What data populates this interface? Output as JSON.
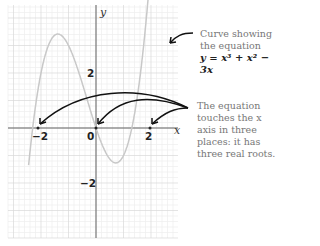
{
  "chart_data": {
    "type": "line",
    "title": "",
    "equation": "y = x³ + x² − 3x",
    "xlabel": "x",
    "ylabel": "y",
    "x_ticks": [
      "−2",
      "0",
      "2"
    ],
    "y_ticks": [
      "2",
      "0",
      "−2"
    ],
    "xlim": [
      -3.3,
      2.9
    ],
    "ylim": [
      -4.2,
      4.5
    ],
    "grid": true,
    "roots": [
      -2.3,
      0,
      1.3
    ],
    "series": [
      {
        "name": "y = x³ + x² − 3x",
        "color": "#c8c8c8"
      }
    ]
  },
  "annotations": {
    "curve_note_line1": "Curve showing",
    "curve_note_line2": "the equation",
    "curve_equation": "y = x³ + x² − 3x",
    "roots_note_line1": "The equation",
    "roots_note_line2": "touches the x",
    "roots_note_line3": "axis in three",
    "roots_note_line4": "places: it has",
    "roots_note_line5": "three real roots."
  },
  "axes": {
    "x_label": "x",
    "y_label": "y",
    "tick_neg2": "−2",
    "tick_0": "0",
    "tick_2": "2",
    "ytick_2": "2",
    "ytick_neg2": "−2"
  },
  "colors": {
    "curve": "#c8c8c8",
    "grid_major": "#d8d8d8",
    "grid_minor": "#eeeeee",
    "axis": "#555555",
    "arrow": "#111111",
    "note": "#777777"
  }
}
